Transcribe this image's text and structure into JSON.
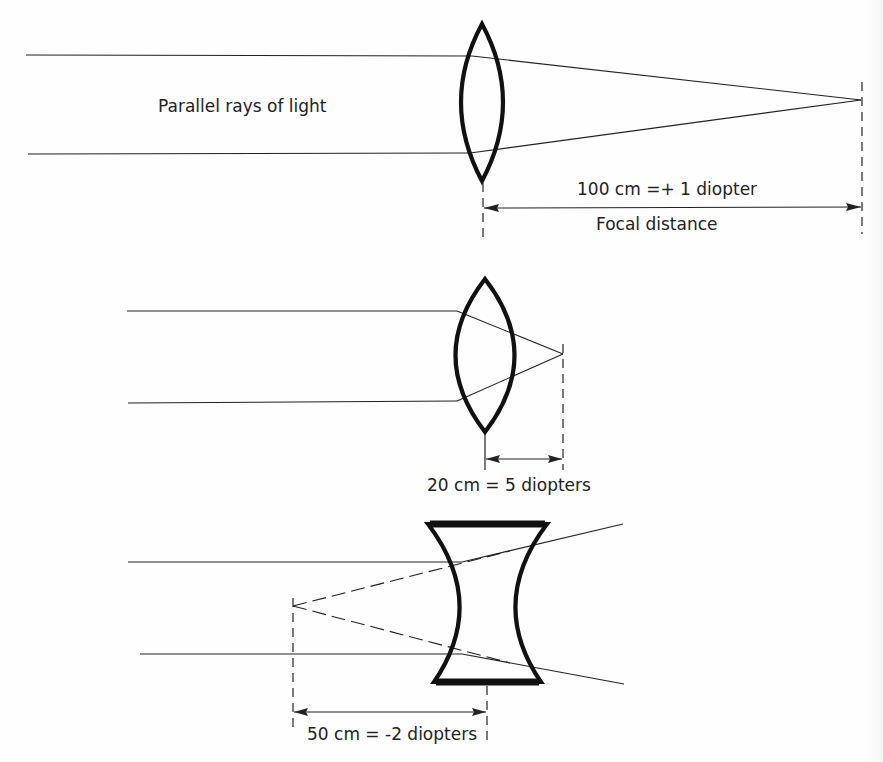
{
  "diagram": {
    "colors": {
      "ink": "#222222",
      "lens": "#111111",
      "background": "#fefefe"
    },
    "panels": [
      {
        "id": "convex-weak",
        "lens_type": "convex",
        "label_rays": "Parallel rays of light",
        "label_measure": "100 cm =+ 1 diopter",
        "label_caption": "Focal distance",
        "focal_length_cm": 100,
        "power_diopters": 1
      },
      {
        "id": "convex-strong",
        "lens_type": "convex",
        "label_measure": "20 cm = 5 diopters",
        "focal_length_cm": 20,
        "power_diopters": 5
      },
      {
        "id": "concave",
        "lens_type": "concave",
        "label_measure": "50 cm = -2 diopters",
        "focal_length_cm": 50,
        "power_diopters": -2
      }
    ]
  }
}
